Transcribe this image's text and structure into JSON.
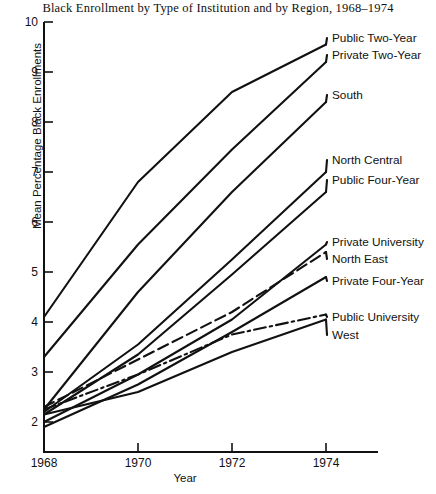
{
  "chart_data": {
    "type": "line",
    "title": "Black Enrollment by Type of Institution and by Region, 1968–1974",
    "xlabel": "Year",
    "ylabel": "Mean Percentage Black Enrollments",
    "x": [
      1968,
      1970,
      1972,
      1974
    ],
    "xticklabels": [
      "1968",
      "1970",
      "1972",
      "1974"
    ],
    "yticklabels": [
      "2",
      "3",
      "4",
      "5",
      "6",
      "7",
      "8",
      "9",
      "10"
    ],
    "yticks": [
      2,
      3,
      4,
      5,
      6,
      7,
      8,
      9,
      10
    ],
    "xlim": [
      1968,
      1974
    ],
    "ylim": [
      1.4,
      10
    ],
    "grid": false,
    "legend_position": "right-inline-labels",
    "series": [
      {
        "name": "Public Two-Year",
        "values": [
          4.1,
          6.8,
          8.6,
          9.55
        ],
        "style": "solid"
      },
      {
        "name": "Private Two-Year",
        "values": [
          3.3,
          5.55,
          7.45,
          9.2
        ],
        "style": "solid"
      },
      {
        "name": "South",
        "values": [
          2.25,
          4.6,
          6.6,
          8.4
        ],
        "style": "solid"
      },
      {
        "name": "North Central",
        "values": [
          2.2,
          3.55,
          5.25,
          7.0
        ],
        "style": "solid"
      },
      {
        "name": "Public Four-Year",
        "values": [
          2.15,
          3.35,
          4.95,
          6.6
        ],
        "style": "solid"
      },
      {
        "name": "Private University",
        "values": [
          2.0,
          2.95,
          4.05,
          5.55
        ],
        "style": "solid"
      },
      {
        "name": "North East",
        "values": [
          2.3,
          3.25,
          4.2,
          5.4
        ],
        "style": "dashed"
      },
      {
        "name": "Private Four-Year",
        "values": [
          1.9,
          2.75,
          3.8,
          4.9
        ],
        "style": "solid"
      },
      {
        "name": "Public University",
        "values": [
          2.25,
          2.95,
          3.75,
          4.15
        ],
        "style": "dash-dot"
      },
      {
        "name": "West",
        "values": [
          2.15,
          2.6,
          3.4,
          4.05
        ],
        "style": "solid"
      }
    ],
    "annotations": [
      {
        "text": "Public Two-Year",
        "x": 332,
        "y": 38
      },
      {
        "text": "Private Two-Year",
        "x": 332,
        "y": 55
      },
      {
        "text": "South",
        "x": 332,
        "y": 95
      },
      {
        "text": "North Central",
        "x": 332,
        "y": 160
      },
      {
        "text": "Public Four-Year",
        "x": 332,
        "y": 180
      },
      {
        "text": "Private University",
        "x": 332,
        "y": 242
      },
      {
        "text": "North East",
        "x": 332,
        "y": 259
      },
      {
        "text": "Private Four-Year",
        "x": 332,
        "y": 281
      },
      {
        "text": "Public University",
        "x": 332,
        "y": 317
      },
      {
        "text": "West",
        "x": 332,
        "y": 335
      }
    ]
  },
  "axis": {
    "yticks": [
      {
        "label": "10",
        "top": 15
      },
      {
        "label": "9",
        "top": 65
      },
      {
        "label": "8",
        "top": 115
      },
      {
        "label": "7",
        "top": 165
      },
      {
        "label": "6",
        "top": 215
      },
      {
        "label": "5",
        "top": 265
      },
      {
        "label": "4",
        "top": 315
      },
      {
        "label": "3",
        "top": 365
      },
      {
        "label": "2",
        "top": 415
      }
    ],
    "xticks": [
      {
        "label": "1968",
        "left": 14
      },
      {
        "label": "1970",
        "left": 108
      },
      {
        "label": "1972",
        "left": 202
      },
      {
        "label": "1974",
        "left": 296
      }
    ]
  },
  "colors": {
    "ink": "#111111",
    "background": "#ffffff"
  }
}
